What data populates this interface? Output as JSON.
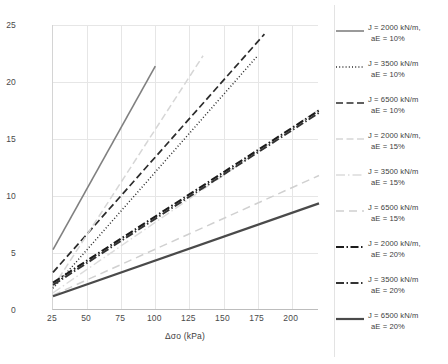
{
  "chart_data": {
    "type": "line",
    "title": "",
    "xlabel": "Δσo (kPa)",
    "ylabel": "Δσv,s (kPa)",
    "xlim": [
      25,
      220
    ],
    "ylim": [
      0,
      25
    ],
    "xticks": [
      25,
      50,
      75,
      100,
      125,
      150,
      175,
      200
    ],
    "yticks": [
      0,
      5,
      10,
      15,
      20,
      25
    ],
    "grid": true,
    "legend_position": "right",
    "series": [
      {
        "name": "J = 2000 kN/m, aE = 10%",
        "label_line1": "J = 2000 kN/m,",
        "label_line2": "aE = 10%",
        "style": "solid",
        "color": "#808080",
        "width": 1.6,
        "x": [
          25,
          100
        ],
        "y": [
          5.3,
          21.4
        ]
      },
      {
        "name": "J = 3500 kN/m, aE = 10%",
        "label_line1": "J = 3500 kN/m",
        "label_line2": "aE = 10%",
        "style": "dotted",
        "color": "#2b2b2b",
        "width": 1.5,
        "x": [
          25,
          175
        ],
        "y": [
          1.9,
          22.3
        ]
      },
      {
        "name": "J = 6500 kN/m, aE = 10%",
        "label_line1": "J = 6500 kN/m",
        "label_line2": "aE = 10%",
        "style": "dashed",
        "color": "#2b2b2b",
        "width": 1.7,
        "x": [
          25,
          180
        ],
        "y": [
          3.3,
          24.2
        ]
      },
      {
        "name": "J = 2000 kN/m, aE = 15%",
        "label_line1": "J = 2000 kN/m,",
        "label_line2": "aE = 15%",
        "style": "dashed",
        "color": "#d6d6d6",
        "width": 1.5,
        "x": [
          25,
          135
        ],
        "y": [
          2.0,
          22.3
        ]
      },
      {
        "name": "J = 3500 kN/m, aE = 15%",
        "label_line1": "J = 3500 kN/m",
        "label_line2": "aE = 15%",
        "style": "dashdot",
        "color": "#dcdcdc",
        "width": 1.4,
        "x": [
          25,
          220
        ],
        "y": [
          1.5,
          17.6
        ]
      },
      {
        "name": "J = 6500 kN/m, aE = 15%",
        "label_line1": "J = 6500 kN/m",
        "label_line2": "aE = 15%",
        "style": "dashed-long",
        "color": "#d0d0d0",
        "width": 1.5,
        "x": [
          25,
          220
        ],
        "y": [
          1.3,
          11.8
        ]
      },
      {
        "name": "J = 2000 kN/m, aE = 20%",
        "label_line1": "J = 2000 kN/m,",
        "label_line2": "aE = 20%",
        "style": "dashdot-thick",
        "color": "#1c1c1c",
        "width": 2.1,
        "x": [
          25,
          220
        ],
        "y": [
          2.4,
          17.5
        ]
      },
      {
        "name": "J = 3500 kN/m, aE = 20%",
        "label_line1": "J = 3500 kN/m",
        "label_line2": "aE = 20%",
        "style": "dashdot-thick",
        "color": "#333333",
        "width": 2.0,
        "x": [
          25,
          220
        ],
        "y": [
          2.2,
          17.3
        ]
      },
      {
        "name": "J = 6500 kN/m, aE = 20%",
        "label_line1": "J = 6500 kN/m",
        "label_line2": "aE = 20%",
        "style": "solid-thick",
        "color": "#4a4a4a",
        "width": 2.2,
        "x": [
          25,
          220
        ],
        "y": [
          1.2,
          9.35
        ]
      }
    ]
  }
}
